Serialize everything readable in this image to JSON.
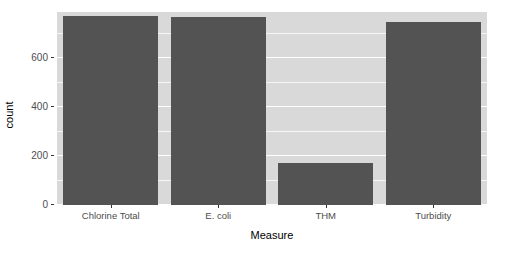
{
  "chart_data": {
    "type": "bar",
    "title": "",
    "xlabel": "Measure",
    "ylabel": "count",
    "categories": [
      "Chlorine Total",
      "E. coli",
      "THM",
      "Turbidity"
    ],
    "values": [
      775,
      770,
      170,
      750
    ],
    "ylim": [
      0,
      790
    ],
    "y_ticks": [
      0,
      200,
      400,
      600
    ],
    "y_tick_labels": [
      "0",
      "200",
      "400",
      "600"
    ],
    "y_minor_ticks": [
      100,
      300,
      500,
      700
    ],
    "grid": true,
    "legend": "none",
    "bar_color": "#535353",
    "panel_color": "#d9d9d9",
    "grid_color": "#ffffff",
    "background_color": "#ffffff"
  }
}
